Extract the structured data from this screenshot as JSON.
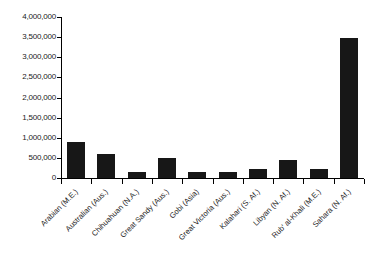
{
  "chart_data": {
    "type": "bar",
    "title": "",
    "subtitle": "",
    "xlabel": "",
    "ylabel": "",
    "categories": [
      "Arabian (M.E.)",
      "Australian (Aus.)",
      "Chihuahuan (N.A.)",
      "Great Sandy (Aus.)",
      "Gobi (Asia)",
      "Great Victoria (Aus.)",
      "Kalahari (S. Af.)",
      "Libyan (N. Af.)",
      "Rub' al-Khali (M.E.)",
      "Sahara (N. Af.)"
    ],
    "values": [
      900000,
      600000,
      140000,
      500000,
      150000,
      140000,
      220000,
      440000,
      230000,
      3480000
    ],
    "ylim": [
      0,
      4000000
    ],
    "ytick_values": [
      0,
      500000,
      1000000,
      1500000,
      2000000,
      2500000,
      3000000,
      3500000,
      4000000
    ],
    "ytick_labels": [
      "0",
      "500,000",
      "1,000,000",
      "1,500,000",
      "2,000,000",
      "2,500,000",
      "3,000,000",
      "3,500,000",
      "4,000,000"
    ],
    "grid": false,
    "legend": false,
    "legend_position": "none",
    "bar_color": "#171717",
    "axis_color": "#000000",
    "background_color": "#ffffff"
  }
}
